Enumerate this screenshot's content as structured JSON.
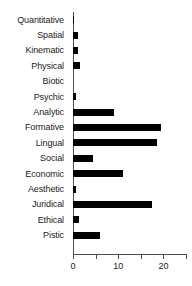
{
  "chart_data": {
    "type": "bar",
    "orientation": "horizontal",
    "title": "",
    "xlabel": "",
    "ylabel": "",
    "xlim": [
      0,
      25
    ],
    "grid": false,
    "legend": null,
    "bar_color": "#000000",
    "axis_color": "#4d4d4d",
    "xticks": [
      0,
      5,
      10,
      15,
      20,
      25
    ],
    "xtick_labels": [
      "0",
      "",
      "10",
      "",
      "20",
      ""
    ],
    "categories": [
      "Quantitative",
      "Spatial",
      "Kinematic",
      "Physical",
      "Biotic",
      "Psychic",
      "Analytic",
      "Formative",
      "Lingual",
      "Social",
      "Economic",
      "Aesthetic",
      "Juridical",
      "Ethical",
      "Pistic"
    ],
    "values": [
      0.3,
      1.2,
      1,
      1.5,
      0,
      0.6,
      9,
      19.5,
      18.5,
      4.5,
      11,
      0.6,
      17.5,
      1.3,
      6
    ]
  }
}
